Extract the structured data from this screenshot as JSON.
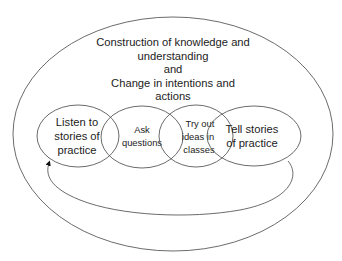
{
  "diagram": {
    "title_lines": [
      "Construction of knowledge and",
      "understanding",
      "and",
      "Change in intentions and",
      "actions"
    ],
    "circles": [
      {
        "lines": [
          "Listen to",
          "stories of",
          "practice"
        ]
      },
      {
        "lines": [
          "Ask",
          "questions"
        ]
      },
      {
        "lines": [
          "Try out",
          "ideas in",
          "classes"
        ]
      },
      {
        "lines": [
          "Tell stories",
          "of practice"
        ]
      }
    ],
    "feedback_arrow": {
      "from": "Tell stories of practice",
      "to": "Listen to stories of practice"
    },
    "colors": {
      "stroke": "#5a5a5a",
      "text": "#222222",
      "background": "#ffffff"
    }
  }
}
